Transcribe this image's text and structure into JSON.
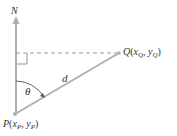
{
  "diagram": {
    "type": "bearing-geometry",
    "colors": {
      "line": "#b0b0b0",
      "text": "#333333",
      "background": "#ffffff"
    },
    "labels": {
      "north": "N",
      "distance": "d",
      "angle": "θ",
      "point_q": {
        "name": "Q",
        "open": "(",
        "x": "x",
        "x_sub": "Q",
        "sep": ", ",
        "y": "y",
        "y_sub": "Q",
        "close": ")"
      },
      "point_p": {
        "name": "P",
        "open": "(",
        "x": "x",
        "x_sub": "P",
        "sep": ", ",
        "y": "y",
        "y_sub": "P",
        "close": ")"
      }
    }
  }
}
